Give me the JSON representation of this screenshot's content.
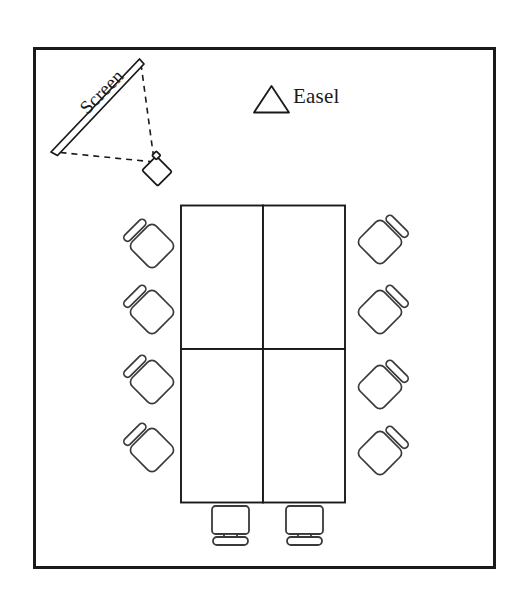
{
  "diagram": {
    "type": "floor-plan",
    "background_color": "#ffffff",
    "stroke_color": "#1a1a1a",
    "room": {
      "name": "room-boundary",
      "x": 33,
      "y": 47,
      "width": 462,
      "height": 521,
      "border_width": 3
    },
    "labels": {
      "screen": "Screen",
      "easel": "Easel"
    },
    "screen": {
      "name": "projection-screen",
      "x1": 140,
      "y1": 62,
      "x2": 53,
      "y2": 152,
      "thickness": 6
    },
    "projector": {
      "name": "projector",
      "cx": 155,
      "cy": 169,
      "size": 19,
      "rotation": 45
    },
    "projection_beam": {
      "name": "projection-beam",
      "style": "dashed",
      "points": "141,63 155,160 54,153"
    },
    "easel_marker": {
      "name": "easel-marker",
      "shape": "triangle",
      "x": 255,
      "y": 87,
      "width": 34,
      "height": 26
    },
    "table": {
      "name": "conference-table",
      "x": 181,
      "y": 205,
      "width": 164,
      "height": 298,
      "columns": 2,
      "rows": 2,
      "v_divider_x": 263,
      "h_divider_y": 349
    },
    "chairs": {
      "count": 8,
      "left": [
        {
          "cx": 152,
          "cy": 245
        },
        {
          "cx": 152,
          "cy": 311
        },
        {
          "cx": 152,
          "cy": 381
        },
        {
          "cx": 152,
          "cy": 449
        }
      ],
      "right": [
        {
          "cx": 380,
          "cy": 241
        },
        {
          "cx": 380,
          "cy": 311
        },
        {
          "cx": 380,
          "cy": 386
        },
        {
          "cx": 380,
          "cy": 452
        }
      ]
    },
    "monitors": [
      {
        "name": "monitor-left",
        "x": 212,
        "y": 506,
        "width": 37,
        "height": 28
      },
      {
        "name": "monitor-right",
        "x": 286,
        "y": 506,
        "width": 37,
        "height": 28
      }
    ]
  }
}
